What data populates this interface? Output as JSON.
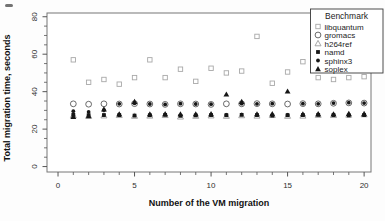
{
  "window": {
    "width": 385,
    "height": 221,
    "bg": "#fdfdfd"
  },
  "colors": {
    "frame": "#777777",
    "tick": "#555555",
    "tick_label": "#2f2f2f",
    "axis_title": "#111111",
    "legend_border": "#3a3a3a",
    "legend_bg": "#ffffff",
    "open_square": "#a8a8a8",
    "open_circle": "#5a5a5a",
    "open_triangle": "#9e9e9e",
    "filled": "#161616"
  },
  "chart_data": {
    "type": "scatter",
    "title": "",
    "xlabel": "Number of the VM migration",
    "ylabel": "Total migration time, seconds",
    "legend_title": "Benchmark",
    "legend_position": "top-right",
    "grid": false,
    "xticks": [
      0,
      5,
      10,
      15,
      20
    ],
    "yticks": [
      0,
      20,
      40,
      60,
      80
    ],
    "x_minor_step": 1,
    "y_minor_step": 5,
    "xlim": [
      -0.72,
      20.45
    ],
    "ylim": [
      -2.9,
      82
    ],
    "x": [
      1,
      2,
      3,
      4,
      5,
      6,
      7,
      8,
      9,
      10,
      11,
      12,
      13,
      14,
      15,
      16,
      17,
      18,
      19,
      20
    ],
    "series": [
      {
        "name": "libquantum",
        "marker": "open-square",
        "values": [
          57,
          45,
          46.5,
          44,
          47.5,
          57,
          47.5,
          52,
          45.5,
          52.5,
          50,
          51,
          69.5,
          44.5,
          50.5,
          56,
          47.5,
          46.5,
          47.5,
          48
        ]
      },
      {
        "name": "gromacs",
        "marker": "open-circle",
        "values": [
          33.5,
          33.3,
          33.5,
          33.4,
          33.6,
          33.4,
          33.2,
          33.5,
          33.4,
          33.2,
          33.5,
          33.5,
          33.6,
          33.5,
          33.4,
          33.6,
          33.5,
          33.8,
          34,
          33.9
        ]
      },
      {
        "name": "h264ref",
        "marker": "open-triangle",
        "values": [
          27.3,
          27,
          27.2,
          27.4,
          27,
          27.1,
          27.4,
          26.6,
          27,
          27.2,
          27,
          27.3,
          27.1,
          27.4,
          27,
          27.1,
          27.5,
          27.4,
          27.6,
          27.8
        ]
      },
      {
        "name": "namd",
        "marker": "filled-square",
        "values": [
          27.6,
          27.4,
          27.5,
          27.5,
          27.2,
          27.4,
          27.6,
          27.1,
          27.3,
          27.5,
          27.4,
          27.6,
          27.5,
          27.2,
          27.4,
          27.5,
          27.6,
          27.5,
          27.3,
          27.5
        ]
      },
      {
        "name": "sphinx3",
        "marker": "filled-circle",
        "values": [
          29.6,
          29.2,
          30.1,
          33.5,
          33.8,
          33.4,
          33.2,
          33.6,
          33.4,
          33.3,
          27.6,
          33.6,
          33.5,
          33.6,
          27.6,
          33.6,
          33.5,
          33.9,
          34.1,
          33.9
        ]
      },
      {
        "name": "soplex",
        "marker": "filled-triangle",
        "values": [
          26.6,
          27,
          30.6,
          28,
          34.6,
          28,
          28.1,
          28,
          28,
          28.1,
          38.6,
          34.6,
          28,
          28.1,
          40.2,
          28,
          28.1,
          28,
          28.2,
          28.1
        ]
      }
    ]
  }
}
